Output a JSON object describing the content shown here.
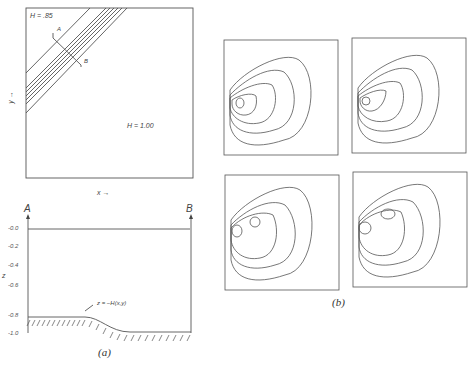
{
  "panel_a": {
    "plan": {
      "h_shallow": "H = .85",
      "h_deep": "H = 1.00",
      "x_axis": "x →",
      "y_axis": "y →",
      "section_start": "A",
      "section_end": "B"
    },
    "section": {
      "left_label": "A",
      "right_label": "B",
      "z_axis": "z",
      "z_ticks": [
        "-0.0",
        "-0.2",
        "-0.4",
        "-0.6",
        "-0.8",
        "-1.0"
      ],
      "bottom_annotation": "z = −H(x,y)"
    },
    "caption": "(a)"
  },
  "panel_b": {
    "caption": "(b)",
    "plots": [
      "contour-1",
      "contour-2",
      "contour-3",
      "contour-4"
    ]
  }
}
